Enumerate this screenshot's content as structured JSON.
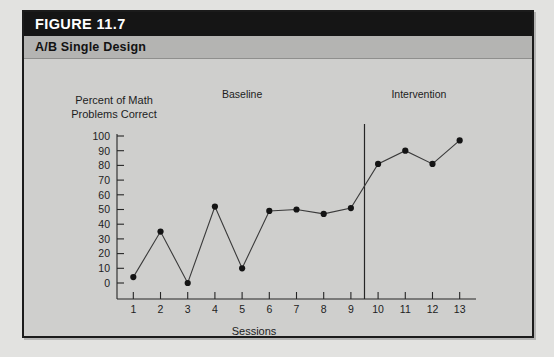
{
  "figure": {
    "number_label": "FIGURE 11.7",
    "subtitle": "A/B Single Design"
  },
  "chart_data": {
    "type": "line",
    "title": "A/B Single Design",
    "xlabel": "Sessions",
    "ylabel": "Percent of Math Problems Correct",
    "ylabel_line1": "Percent of Math",
    "ylabel_line2": "Problems Correct",
    "x": [
      1,
      2,
      3,
      4,
      5,
      6,
      7,
      8,
      9,
      10,
      11,
      12,
      13
    ],
    "values": [
      4,
      35,
      0,
      52,
      10,
      49,
      50,
      47,
      51,
      81,
      90,
      81,
      97
    ],
    "xticklabels": [
      "1",
      "2",
      "3",
      "4",
      "5",
      "6",
      "7",
      "8",
      "9",
      "10",
      "11",
      "12",
      "13"
    ],
    "yticks": [
      0,
      10,
      20,
      30,
      40,
      50,
      60,
      70,
      80,
      90,
      100
    ],
    "yticklabels": [
      "0",
      "10",
      "20",
      "30",
      "40",
      "50",
      "60",
      "70",
      "80",
      "90",
      "100"
    ],
    "ylim": [
      0,
      100
    ],
    "xlim": [
      0.4,
      13.6
    ],
    "grid": false,
    "legend": "none",
    "marker": "filled-circle",
    "line_color": "#3a3a3a",
    "marker_color": "#141414",
    "background_color": "#cfcfcd",
    "phase_change_x": 9.5,
    "phases": [
      {
        "name": "Baseline",
        "label": "Baseline",
        "start": 1,
        "end": 9
      },
      {
        "name": "Intervention",
        "label": "Intervention",
        "start": 10,
        "end": 13
      }
    ],
    "annotations": [
      {
        "text": "Baseline",
        "x": 5,
        "position": "top"
      },
      {
        "text": "Intervention",
        "x": 11.5,
        "position": "top"
      }
    ]
  }
}
